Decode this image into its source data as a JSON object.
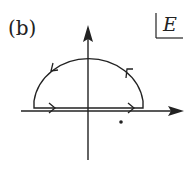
{
  "figure": {
    "panel_label": "(b)",
    "plane_label": "E",
    "colors": {
      "stroke": "#222222",
      "background": "#ffffff"
    }
  },
  "axes": {
    "horizontal": {
      "name": "real-axis",
      "arrow": "right"
    },
    "vertical": {
      "name": "imaginary-axis",
      "arrow": "up"
    }
  },
  "contour": {
    "shape": "semicircle-upper",
    "direction": "counterclockwise",
    "arrows_on_line": 2,
    "arrows_on_arc": 2
  },
  "points": [
    {
      "name": "pole",
      "position": "lower-half-plane, right of origin"
    }
  ]
}
